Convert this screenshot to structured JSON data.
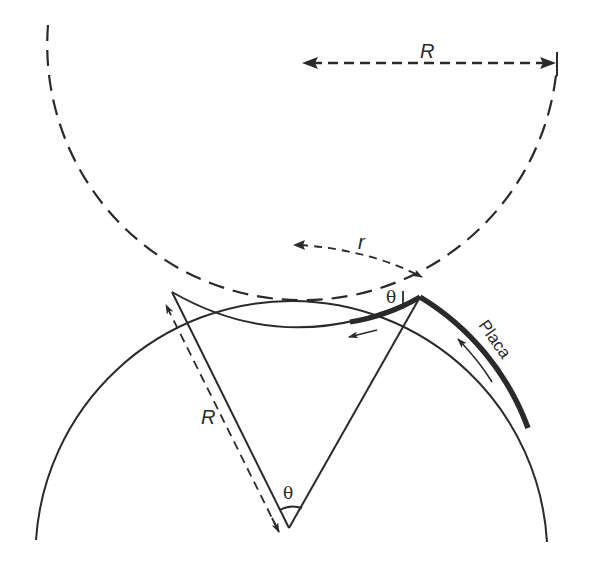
{
  "diagram": {
    "type": "geometry",
    "labels": {
      "top_radius": "R",
      "side_radius": "R",
      "arc_length": "r",
      "angle_center": "θ",
      "angle_contact": "θ",
      "plate": "Placa"
    },
    "colors": {
      "ink": "#2a2a2a",
      "background": "#ffffff"
    },
    "elements": [
      {
        "id": "upper-circle",
        "style": "dashed",
        "center": [
          302,
          62
        ],
        "radius": 255
      },
      {
        "id": "lower-circle",
        "style": "solid",
        "center": [
          291,
          517
        ],
        "radius": 256
      },
      {
        "id": "inner-arc",
        "style": "solid",
        "from": [
          172,
          292
        ],
        "to": [
          420,
          297
        ]
      },
      {
        "id": "plate-segment",
        "style": "thick",
        "label": "Placa"
      },
      {
        "id": "radius-lines",
        "from_vertex": [
          289,
          528
        ],
        "to": [
          [
            172,
            292
          ],
          [
            420,
            297
          ]
        ]
      }
    ]
  }
}
